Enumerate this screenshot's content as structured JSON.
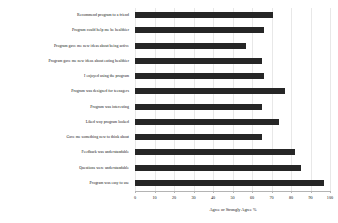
{
  "chart_data": {
    "type": "bar",
    "orientation": "horizontal",
    "title": "",
    "subtitle": "",
    "xlabel": "Agree or Strongly Agree %",
    "ylabel": "",
    "xlim": [
      0,
      100
    ],
    "xticks": [
      0,
      10,
      20,
      30,
      40,
      50,
      60,
      70,
      80,
      90,
      100
    ],
    "xtick_labels": [
      "0",
      "10",
      "20",
      "30",
      "40",
      "50",
      "60",
      "70",
      "80",
      "90",
      "100"
    ],
    "grid": true,
    "grid_axis": "x",
    "legend": false,
    "bar_color": "#262626",
    "categories": [
      "Recommend program to a friend",
      "Program could help me be healthier",
      "Program gave me new ideas about being active",
      "Program gave me new ideas about eating healthier",
      "I enjoyed using the program",
      "Program was designed for teenagers",
      "Program was interesting",
      "Liked way program looked",
      "Gave me something new to think about",
      "Feedback was understandable",
      "Questions were understandable",
      "Program was easy to use"
    ],
    "values": [
      71,
      66,
      57,
      65,
      66,
      77,
      65,
      74,
      65,
      82,
      85,
      97
    ]
  }
}
